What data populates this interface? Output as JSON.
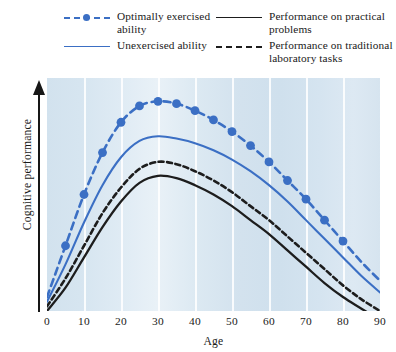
{
  "legend": {
    "entries": [
      {
        "key": "optimally_exercised",
        "label": "Optimally exercised\nability",
        "style": "blue-dashed-dot",
        "color": "#3b6fc4"
      },
      {
        "key": "unexercised",
        "label": "Unexercised ability",
        "style": "blue-solid",
        "color": "#3b6fc4"
      },
      {
        "key": "practical",
        "label": "Performance on practical\nproblems",
        "style": "black-solid",
        "color": "#1d1d1d"
      },
      {
        "key": "traditional",
        "label": "Performance on traditional\nlaboratory tasks",
        "style": "black-dashed",
        "color": "#1d1d1d"
      }
    ]
  },
  "axes": {
    "x_label": "Age",
    "y_label": "Cognitive performance",
    "x_ticks": [
      "0",
      "10",
      "20",
      "30",
      "40",
      "50",
      "60",
      "70",
      "80",
      "90"
    ],
    "y_ticks": []
  },
  "colors": {
    "blue": "#3b6fc4",
    "black": "#1d1d1d",
    "plot_background": "#d6e4ef",
    "gridline": "#ffffff"
  },
  "chart_data": {
    "type": "line",
    "title": "",
    "xlabel": "Age",
    "ylabel": "Cognitive performance",
    "xlim": [
      0,
      90
    ],
    "ylim": [
      0,
      100
    ],
    "grid": "vertical-only",
    "legend_position": "top",
    "x": [
      0,
      5,
      10,
      15,
      20,
      25,
      30,
      35,
      40,
      45,
      50,
      55,
      60,
      65,
      70,
      75,
      80,
      85,
      90
    ],
    "series": [
      {
        "name": "Optimally exercised ability",
        "color": "#3b6fc4",
        "line_style": "dashed",
        "markers": true,
        "marker_x": [
          5,
          10,
          15,
          20,
          25,
          30,
          35,
          40,
          45,
          50,
          55,
          60,
          65,
          70,
          75,
          80
        ],
        "values": [
          6,
          28,
          50,
          68,
          81,
          88,
          90,
          89,
          86,
          82,
          77,
          71,
          64,
          56,
          48,
          39,
          30,
          21,
          13
        ]
      },
      {
        "name": "Unexercised ability",
        "color": "#3b6fc4",
        "line_style": "solid",
        "markers": false,
        "values": [
          4,
          20,
          38,
          54,
          66,
          73,
          75,
          74,
          72,
          69,
          65,
          60,
          54,
          47,
          39,
          31,
          23,
          15,
          8
        ]
      },
      {
        "name": "Performance on traditional laboratory tasks",
        "color": "#1d1d1d",
        "line_style": "dashed",
        "markers": false,
        "values": [
          2,
          14,
          28,
          42,
          53,
          61,
          64,
          63,
          60,
          56,
          51,
          45,
          39,
          32,
          25,
          18,
          11,
          5,
          0
        ]
      },
      {
        "name": "Performance on practical problems",
        "color": "#1d1d1d",
        "line_style": "solid",
        "markers": false,
        "values": [
          0,
          10,
          23,
          36,
          47,
          55,
          58,
          57,
          54,
          50,
          45,
          39,
          33,
          26,
          19,
          12,
          6,
          1,
          -4
        ]
      }
    ]
  }
}
